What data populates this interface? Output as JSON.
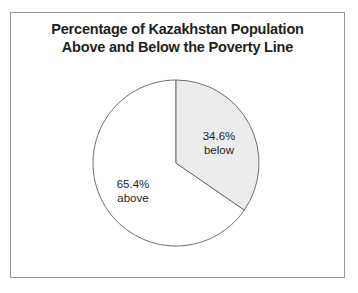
{
  "figure": {
    "background": "#ffffff",
    "frame_color": "#9a9a9a"
  },
  "title": {
    "line1": "Percentage of Kazakhstan Population",
    "line2": "Above and Below the Poverty Line",
    "color": "#231f20"
  },
  "labels": {
    "below": {
      "percent": "34.6%",
      "name": "below"
    },
    "above": {
      "percent": "65.4%",
      "name": "above"
    }
  },
  "chart_data": {
    "type": "pie",
    "title": "Percentage of Kazakhstan Population Above and Below the Poverty Line",
    "labels": [
      "below",
      "above"
    ],
    "values": [
      34.6,
      65.4
    ],
    "value_labels": [
      "34.6%",
      "65.4%"
    ],
    "units": "percent",
    "total": 100.0,
    "start_angle_deg": 0,
    "direction": "clockwise",
    "slice_colors": [
      "#ececec",
      "#ffffff"
    ],
    "slice_edge_color": "#6f6f6f",
    "legend": "none",
    "annotations": [
      "34.6% below",
      "65.4% above"
    ],
    "grid": false
  }
}
